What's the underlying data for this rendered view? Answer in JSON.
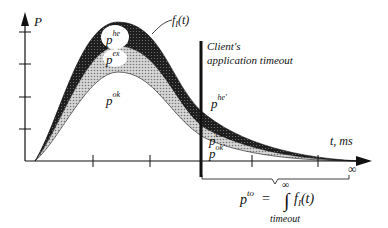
{
  "diagram": {
    "y_axis_label": "P",
    "x_axis_label": "t, ms",
    "curve_label": "f",
    "curve_label_subscript": "I",
    "curve_label_arg": "(t)",
    "timeout_label_line1": "Client's",
    "timeout_label_line2": "application timeout",
    "regions": {
      "he": {
        "base": "p",
        "sup": "he"
      },
      "ex": {
        "base": "p",
        "sup": "ex"
      },
      "ok": {
        "base": "p",
        "sup": "ok"
      },
      "he_prime": {
        "base": "p",
        "sup": "he'"
      },
      "ex_prime": {
        "base": "p",
        "sup": "ex'"
      },
      "ok_prime": {
        "base": "p",
        "sup": "ok'"
      }
    },
    "infinity_symbol": "∞",
    "formula": {
      "lhs_base": "p",
      "lhs_sup": "to",
      "equals": "=",
      "integral": "∫",
      "upper_limit": "∞",
      "integrand": "f",
      "integrand_sub": "I",
      "integrand_arg": "(t)",
      "lower_limit": "timeout"
    },
    "colors": {
      "he_band": "#2a2a2a",
      "ex_band": "#bdbdbd",
      "axis": "#111111",
      "background": "#ffffff"
    }
  }
}
